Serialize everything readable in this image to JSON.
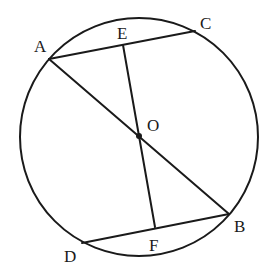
{
  "diagram": {
    "type": "circle-geometry",
    "circle": {
      "center": "O",
      "cx": 139,
      "cy": 137,
      "r": 119
    },
    "points": {
      "A": {
        "label": "A",
        "x": 49,
        "y": 59,
        "lx": 34,
        "ly": 52
      },
      "C": {
        "label": "C",
        "x": 195,
        "y": 31,
        "lx": 200,
        "ly": 29
      },
      "E": {
        "label": "E",
        "x": 123,
        "y": 45,
        "lx": 117,
        "ly": 39
      },
      "O": {
        "label": "O",
        "x": 139,
        "y": 136,
        "lx": 147,
        "ly": 131
      },
      "B": {
        "label": "B",
        "x": 229,
        "y": 214,
        "lx": 234,
        "ly": 232
      },
      "D": {
        "label": "D",
        "x": 82,
        "y": 243,
        "lx": 64,
        "ly": 262
      },
      "F": {
        "label": "F",
        "x": 155,
        "y": 227,
        "lx": 149,
        "ly": 251
      }
    },
    "segments": [
      {
        "name": "AC",
        "from": "A",
        "to": "C"
      },
      {
        "name": "AB",
        "from": "A",
        "to": "B"
      },
      {
        "name": "EF",
        "from": "E",
        "to": "F"
      },
      {
        "name": "DB",
        "from": "D",
        "to": "B"
      }
    ]
  }
}
